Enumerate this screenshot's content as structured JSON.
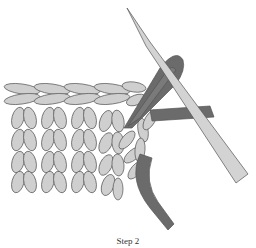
{
  "figure": {
    "caption": "Step 2",
    "colors": {
      "yarn_light": "#cfcfcf",
      "yarn_dark": "#6b6b6b",
      "needle": "#d3d3d3",
      "outline": "#555555",
      "background": "#ffffff"
    }
  }
}
